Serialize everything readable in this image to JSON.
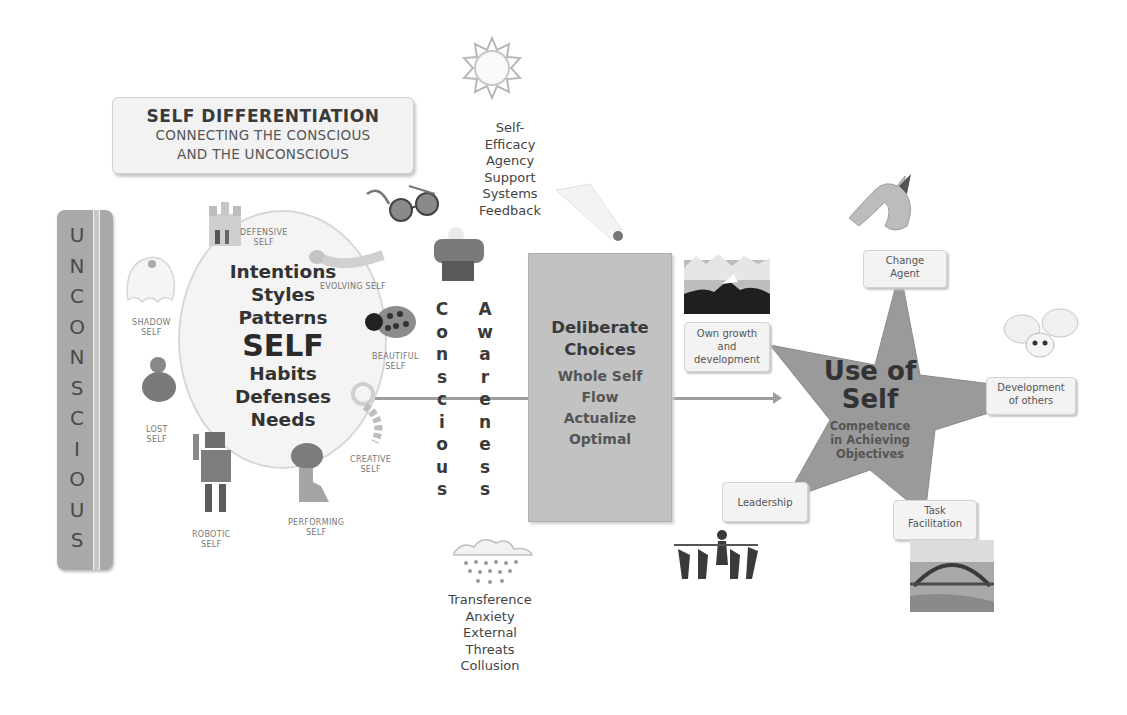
{
  "title_box": {
    "title": "SELF DIFFERENTIATION",
    "subtitle_line1": "CONNECTING THE CONSCIOUS",
    "subtitle_line2": "AND THE UNCONSCIOUS"
  },
  "unconscious_bar": {
    "label": "UNCONSCIOUS",
    "letters": [
      "U",
      "N",
      "C",
      "O",
      "N",
      "S",
      "C",
      "I",
      "O",
      "U",
      "S"
    ]
  },
  "self_circle": {
    "words": [
      "Intentions",
      "Styles",
      "Patterns",
      "SELF",
      "Habits",
      "Defenses",
      "Needs"
    ],
    "selves": [
      {
        "line1": "DEFENSIVE",
        "line2": "SELF",
        "icon": "castle-icon"
      },
      {
        "line1": "EVOLVING SELF",
        "line2": "",
        "icon": "caterpillar-icon"
      },
      {
        "line1": "SHADOW",
        "line2": "SELF",
        "icon": "ghost-icon"
      },
      {
        "line1": "BEAUTIFUL",
        "line2": "SELF",
        "icon": "ladybug-icon"
      },
      {
        "line1": "LOST",
        "line2": "SELF",
        "icon": "duck-icon"
      },
      {
        "line1": "CREATIVE",
        "line2": "SELF",
        "icon": "flower-icon"
      },
      {
        "line1": "ROBOTIC",
        "line2": "SELF",
        "icon": "robot-icon"
      },
      {
        "line1": "PERFORMING",
        "line2": "SELF",
        "icon": "performer-icon"
      }
    ]
  },
  "positive_factors": {
    "icon": "sun-icon",
    "lines": [
      "Self-",
      "Efficacy",
      "Agency",
      "Support",
      "Systems",
      "Feedback"
    ]
  },
  "negative_factors": {
    "icon": "rain-cloud-icon",
    "lines": [
      "Transference",
      "Anxiety",
      "External",
      "Threats",
      "Collusion"
    ]
  },
  "conscious_column": {
    "word": "Conscious",
    "letters": [
      "C",
      "o",
      "n",
      "s",
      "c",
      "i",
      "o",
      "u",
      "s"
    ]
  },
  "awareness_column": {
    "word": "Awareness",
    "letters": [
      "A",
      "w",
      "a",
      "r",
      "e",
      "n",
      "e",
      "s",
      "s"
    ]
  },
  "deliberate_choices": {
    "title_line1": "Deliberate",
    "title_line2": "Choices",
    "items": [
      "Whole Self",
      "Flow",
      "Actualize",
      "Optimal"
    ]
  },
  "use_of_self": {
    "title_line1": "Use of",
    "title_line2": "Self",
    "subtitle": [
      "Competence",
      "in Achieving",
      "Objectives"
    ],
    "outcomes": [
      {
        "label_line1": "Change",
        "label_line2": "Agent",
        "icon": "dragon-icon"
      },
      {
        "label_line1": "Own growth",
        "label_line2": "and",
        "label_line3": "development",
        "icon": "mountain-icon"
      },
      {
        "label_line1": "Development",
        "label_line2": "of others",
        "icon": "fairy-icon"
      },
      {
        "label_line1": "Leadership",
        "label_line2": "",
        "icon": "people-group-icon"
      },
      {
        "label_line1": "Task",
        "label_line2": "Facilitation",
        "icon": "bridge-icon"
      }
    ]
  },
  "colors": {
    "box_gray": "#c2c2c2",
    "bar_gray": "#a9a9a9",
    "star_gray": "#9a9a9a",
    "text_dark": "#333333"
  }
}
